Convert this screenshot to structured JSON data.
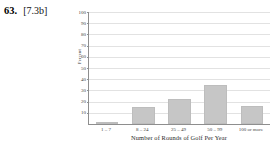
{
  "problem": {
    "number": "63.",
    "reference": "[7.3b]"
  },
  "chart_data": {
    "type": "bar",
    "title": "",
    "subtitle": "",
    "xlabel": "Number of Rounds of Golf Per Year",
    "ylabel": "Percent",
    "categories": [
      "1 – 7",
      "8 – 24",
      "25 – 49",
      "50 – 99",
      "100 or more"
    ],
    "values": [
      2,
      15,
      22,
      35,
      16
    ],
    "ylim": [
      0,
      100
    ],
    "yticks": [
      10,
      20,
      30,
      40,
      50,
      60,
      70,
      80,
      90,
      100
    ],
    "ytick_labels": [
      "10",
      "20",
      "30",
      "40",
      "50",
      "60",
      "70",
      "80",
      "90",
      "100"
    ],
    "grid": true,
    "legend": "none",
    "bar_color": "#c6c6c6",
    "bar_edge_color": "#bdbdbd",
    "axis_color": "#8e8e8e",
    "gridline_color": "#e2e2e2"
  }
}
